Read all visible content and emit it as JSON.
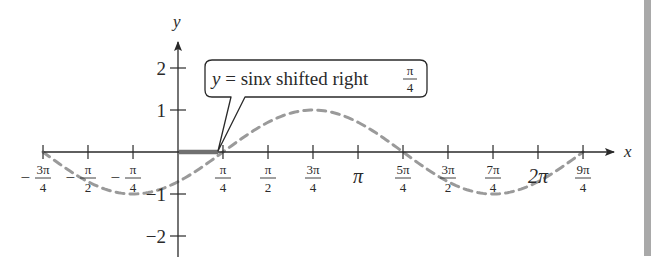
{
  "chart_data": {
    "type": "line",
    "title": "",
    "function": "y = sin(x - π/4)",
    "xlabel": "x",
    "ylabel": "y",
    "xlim_radians": [
      -2.356,
      7.069
    ],
    "ylim": [
      -2,
      2
    ],
    "grid": false,
    "x_ticks": [
      {
        "value": -2.356,
        "num": "3π",
        "den": "4",
        "neg": true
      },
      {
        "value": -1.571,
        "num": "π",
        "den": "2",
        "neg": true
      },
      {
        "value": -0.785,
        "num": "π",
        "den": "4",
        "neg": true
      },
      {
        "value": 0.785,
        "num": "π",
        "den": "4",
        "neg": false
      },
      {
        "value": 1.571,
        "num": "π",
        "den": "2",
        "neg": false
      },
      {
        "value": 2.356,
        "num": "3π",
        "den": "4",
        "neg": false
      },
      {
        "value": 3.142,
        "label": "π"
      },
      {
        "value": 3.927,
        "num": "5π",
        "den": "4",
        "neg": false
      },
      {
        "value": 4.712,
        "num": "3π",
        "den": "2",
        "neg": false
      },
      {
        "value": 5.498,
        "num": "7π",
        "den": "4",
        "neg": false
      },
      {
        "value": 6.283,
        "label": "2π"
      },
      {
        "value": 7.069,
        "num": "9π",
        "den": "4",
        "neg": false
      }
    ],
    "y_ticks": [
      {
        "value": 2,
        "label": "2"
      },
      {
        "value": 1,
        "label": "1"
      },
      {
        "value": -1,
        "label": "−1"
      },
      {
        "value": -2,
        "label": "−2"
      }
    ],
    "series": [
      {
        "name": "y = sin x shifted right π/4",
        "style": "dashed",
        "color": "#9a9a9a",
        "x": [
          -2.356,
          -1.571,
          -0.785,
          0,
          0.785,
          1.571,
          2.356,
          3.142,
          3.927,
          4.712,
          5.498,
          6.283,
          7.069
        ],
        "y": [
          0,
          -0.707,
          -1,
          -0.707,
          0,
          0.707,
          1,
          0.707,
          0,
          -0.707,
          -1,
          -0.707,
          0
        ]
      }
    ],
    "highlight_segment": {
      "from": 0,
      "to": 0.785,
      "color": "#707070",
      "meaning": "shift of π/4"
    },
    "annotations": [
      {
        "text_prefix": "y = sin",
        "text_var": "x",
        "text_suffix": " shifted right ",
        "frac_num": "π",
        "frac_den": "4",
        "points_to": [
          0.785,
          0
        ]
      }
    ]
  },
  "colors": {
    "axis": "#2a2a2a",
    "curve": "#9a9a9a",
    "shift_bar": "#707070",
    "side_bar": "#a9a9a9"
  }
}
